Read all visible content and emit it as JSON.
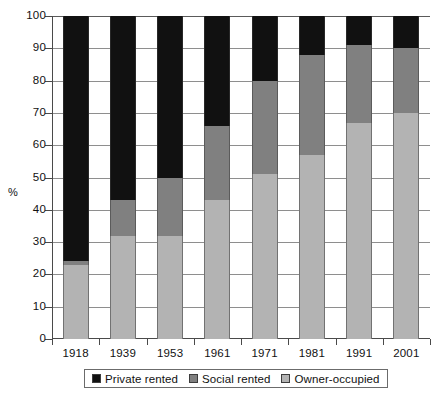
{
  "chart_data": {
    "type": "bar",
    "stacked": true,
    "title": "",
    "xlabel": "",
    "ylabel": "%",
    "ylim": [
      0,
      100
    ],
    "yticks": [
      0,
      10,
      20,
      30,
      40,
      50,
      60,
      70,
      80,
      90,
      100
    ],
    "grid": true,
    "legend_position": "bottom",
    "categories": [
      "1918",
      "1939",
      "1953",
      "1961",
      "1971",
      "1981",
      "1991",
      "2001"
    ],
    "series": [
      {
        "name": "Owner-occupied",
        "color": "#b3b3b3",
        "values": [
          23,
          32,
          32,
          43,
          51,
          57,
          67,
          70
        ]
      },
      {
        "name": "Social rented",
        "color": "#808080",
        "values": [
          1,
          11,
          18,
          23,
          29,
          31,
          24,
          20
        ]
      },
      {
        "name": "Private rented",
        "color": "#111111",
        "values": [
          76,
          57,
          50,
          34,
          20,
          12,
          9,
          10
        ]
      }
    ],
    "cumulative_tops": {
      "owner_occupied": [
        23,
        32,
        32,
        43,
        51,
        57,
        67,
        70
      ],
      "social_rented_top": [
        24,
        43,
        50,
        66,
        80,
        88,
        91,
        90
      ]
    }
  },
  "axes": {
    "y_unit_label": "%",
    "y_tick_labels": [
      "0",
      "10",
      "20",
      "30",
      "40",
      "50",
      "60",
      "70",
      "80",
      "90",
      "100"
    ],
    "x_tick_labels": [
      "1918",
      "1939",
      "1953",
      "1961",
      "1971",
      "1981",
      "1991",
      "2001"
    ]
  },
  "legend": {
    "items": [
      {
        "label": "Private rented",
        "color": "#111111"
      },
      {
        "label": "Social rented",
        "color": "#808080"
      },
      {
        "label": "Owner-occupied",
        "color": "#b3b3b3"
      }
    ]
  }
}
